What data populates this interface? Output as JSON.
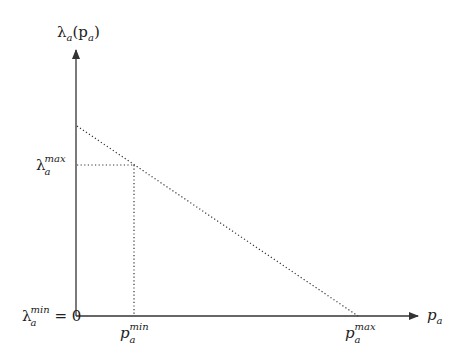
{
  "diagram": {
    "y_axis_label": {
      "base": "λ",
      "sub": "a",
      "paren": "(p",
      "paren_sub": "a",
      "close": ")"
    },
    "x_axis_label": {
      "base": "p",
      "sub": "a"
    },
    "y_ticks": [
      {
        "base": "λ",
        "sub": "a",
        "sup": "max",
        "suffix": ""
      },
      {
        "base": "λ",
        "sub": "a",
        "sup": "min",
        "suffix": " = 0"
      }
    ],
    "x_ticks": [
      {
        "base": "p",
        "sub": "a",
        "sup": "min"
      },
      {
        "base": "p",
        "sub": "a",
        "sup": "max"
      }
    ],
    "geometry": {
      "origin": [
        76,
        316
      ],
      "y_axis_top": 48,
      "x_axis_right": 420,
      "line_start": [
        76,
        126
      ],
      "line_end": [
        358,
        316
      ],
      "point": [
        133,
        165
      ]
    },
    "colors": {
      "stroke": "#333333",
      "text": "#222222",
      "background": "#ffffff"
    }
  }
}
